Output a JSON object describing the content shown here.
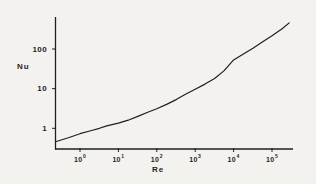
{
  "figure": {
    "background_color": "#f3f2ef",
    "ink_color": "#1f1f1f"
  },
  "chart_data": {
    "type": "line",
    "title": "",
    "xlabel": "Re",
    "ylabel": "Nu",
    "x_scale": "log",
    "y_scale": "log",
    "xlim": [
      0.23,
      280000
    ],
    "ylim": [
      0.3,
      600
    ],
    "grid": false,
    "legend": false,
    "x_ticks": [
      {
        "value": 1,
        "base": "10",
        "exp": "0"
      },
      {
        "value": 10,
        "base": "10",
        "exp": "1"
      },
      {
        "value": 100,
        "base": "10",
        "exp": "2"
      },
      {
        "value": 1000,
        "base": "10",
        "exp": "3"
      },
      {
        "value": 10000,
        "base": "10",
        "exp": "4"
      },
      {
        "value": 100000,
        "base": "10",
        "exp": "5"
      }
    ],
    "y_ticks": [
      {
        "value": 1,
        "label": "1"
      },
      {
        "value": 10,
        "label": "10"
      },
      {
        "value": 100,
        "label": "100"
      }
    ],
    "series": [
      {
        "name": "Nu-vs-Re-curve",
        "points": [
          [
            0.23,
            0.46
          ],
          [
            0.5,
            0.58
          ],
          [
            1,
            0.73
          ],
          [
            2,
            0.88
          ],
          [
            3.2,
            1.0
          ],
          [
            5,
            1.15
          ],
          [
            10,
            1.35
          ],
          [
            18,
            1.6
          ],
          [
            32,
            2.0
          ],
          [
            56,
            2.5
          ],
          [
            100,
            3.1
          ],
          [
            180,
            4.0
          ],
          [
            320,
            5.3
          ],
          [
            560,
            7.2
          ],
          [
            1000,
            9.7
          ],
          [
            1800,
            13
          ],
          [
            3200,
            18
          ],
          [
            5600,
            28
          ],
          [
            10000,
            53
          ],
          [
            18000,
            75
          ],
          [
            32000,
            105
          ],
          [
            56000,
            150
          ],
          [
            100000,
            215
          ],
          [
            180000,
            320
          ],
          [
            280000,
            455
          ]
        ]
      }
    ]
  }
}
